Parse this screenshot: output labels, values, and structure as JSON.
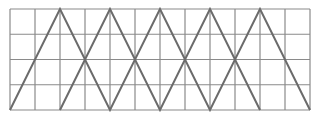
{
  "diagram": {
    "type": "grid-with-zigzag-lines",
    "grid": {
      "columns": 12,
      "rows": 4,
      "x0": 10,
      "y0": 9,
      "cell_width": 25,
      "cell_height": 25.25,
      "line_color": "#8a8a8a"
    },
    "zigzag_color": "#6b6b6b",
    "zigzags": [
      {
        "name": "zigzag-a",
        "points": [
          [
            10,
            110
          ],
          [
            60,
            9
          ],
          [
            110,
            110
          ],
          [
            160,
            9
          ],
          [
            210,
            110
          ],
          [
            260,
            9
          ],
          [
            310,
            110
          ]
        ]
      },
      {
        "name": "zigzag-b",
        "points": [
          [
            60,
            110
          ],
          [
            110,
            9
          ],
          [
            160,
            110
          ],
          [
            210,
            9
          ],
          [
            260,
            110
          ]
        ]
      }
    ]
  }
}
